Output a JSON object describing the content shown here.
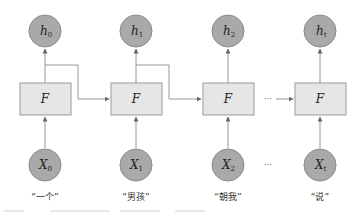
{
  "diagram": {
    "type": "unrolled-rnn",
    "function_label": "F",
    "ellipsis": "···",
    "columns": [
      {
        "hidden": {
          "symbol": "h",
          "sub": "0"
        },
        "input": {
          "symbol": "X",
          "sub": "0"
        },
        "word": "“一个”"
      },
      {
        "hidden": {
          "symbol": "h",
          "sub": "1"
        },
        "input": {
          "symbol": "X",
          "sub": "1"
        },
        "word": "“男孩”"
      },
      {
        "hidden": {
          "symbol": "h",
          "sub": "2"
        },
        "input": {
          "symbol": "X",
          "sub": "2"
        },
        "word": "“朝我”"
      },
      {
        "hidden": {
          "symbol": "h",
          "sub": "t"
        },
        "input": {
          "symbol": "X",
          "sub": "t"
        },
        "word": "“说”"
      }
    ],
    "colors": {
      "circle_fill": "#a9a9a9",
      "box_fill": "#e6e6e6",
      "edge": "#8c8c8c"
    }
  }
}
